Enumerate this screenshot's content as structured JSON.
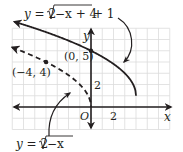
{
  "chart_data": {
    "type": "line",
    "title": "",
    "xlabel": "x",
    "ylabel": "y",
    "origin_label": "O",
    "x_tick_labels": [
      "2"
    ],
    "y_tick_labels": [
      "2"
    ],
    "xlim": [
      -7,
      7
    ],
    "ylim": [
      -2,
      7
    ],
    "grid": true,
    "unit_px": 11.25,
    "series": [
      {
        "name": "y = 2√(−x + 4) + 1",
        "style": "solid",
        "domain": [
          -7.5,
          4
        ],
        "endpoint": [
          4,
          1
        ],
        "points": [
          [
            -7.5,
            7.78
          ],
          [
            -6,
            7.32
          ],
          [
            -4,
            6.66
          ],
          [
            -2,
            5.9
          ],
          [
            0,
            5
          ],
          [
            1,
            4.46
          ],
          [
            2,
            3.83
          ],
          [
            3,
            3
          ],
          [
            3.75,
            2
          ],
          [
            4,
            1
          ]
        ]
      },
      {
        "name": "y = 2√(−x)",
        "style": "dashed",
        "domain": [
          -7.5,
          0
        ],
        "endpoint": [
          0,
          0
        ],
        "points": [
          [
            -7.5,
            5.48
          ],
          [
            -6,
            4.9
          ],
          [
            -4,
            4
          ],
          [
            -2,
            2.83
          ],
          [
            -1,
            2
          ],
          [
            -0.25,
            1
          ],
          [
            0,
            0
          ]
        ]
      }
    ],
    "annotations": [
      {
        "text": "(0, 5)",
        "point": [
          0,
          5
        ]
      },
      {
        "text": "(−4, 4)",
        "point": [
          -4,
          4
        ]
      }
    ],
    "arrow_annotations": [
      "curved arrow from transformed-function label down-right to solid curve",
      "curved arrow from parent-function label up-right to dashed curve"
    ]
  },
  "labels": {
    "top_eq_prefix": "y = 2",
    "top_eq_radicand": "−x + 4",
    "top_eq_suffix": " + 1",
    "bottom_eq_prefix": "y = 2",
    "bottom_eq_radicand": "−x",
    "point_a": "(0, 5)",
    "point_b": "(−4, 4)",
    "x_axis": "x",
    "y_axis": "y",
    "origin": "O",
    "x_tick": "2",
    "y_tick": "2"
  },
  "colors": {
    "curve": "#231f20",
    "grid": "#d9d9d9",
    "axis": "#231f20"
  }
}
